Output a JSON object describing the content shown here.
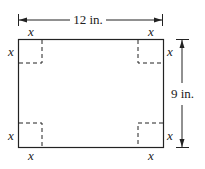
{
  "diagram": {
    "type": "box-net-rectangle",
    "width_label": "12 in.",
    "height_label": "9 in.",
    "corner_cut_label": "x",
    "colors": {
      "stroke": "#222222",
      "background": "#ffffff"
    }
  }
}
